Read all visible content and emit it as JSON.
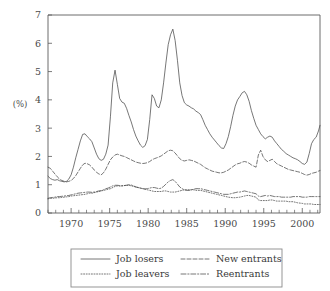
{
  "chart_data": {
    "type": "line",
    "title": "",
    "xlabel": "",
    "ylabel": "(%)",
    "ylim": [
      0,
      7
    ],
    "xlim": [
      1967.0,
      2002.3
    ],
    "yticks": [
      "0",
      "1",
      "2",
      "3",
      "4",
      "5",
      "6",
      "7"
    ],
    "ytick_values": [
      0,
      1,
      2,
      3,
      4,
      5,
      6,
      7
    ],
    "xticks": [
      "1970",
      "1975",
      "1980",
      "1985",
      "1990",
      "1995",
      "2000"
    ],
    "xtick_values": [
      1970,
      1975,
      1980,
      1985,
      1990,
      1995,
      2000
    ],
    "grid": false,
    "legend_position": "below-center",
    "legend_entries": [
      {
        "label": "Job losers",
        "style": "solid"
      },
      {
        "label": "Job leavers",
        "style": "dotted"
      },
      {
        "label": "New entrants",
        "style": "dashed"
      },
      {
        "label": "Reentrants",
        "style": "dashdot"
      }
    ],
    "x": [
      1967.0,
      1967.3,
      1967.6,
      1967.9,
      1968.2,
      1968.5,
      1968.8,
      1969.1,
      1969.4,
      1969.7,
      1970.0,
      1970.3,
      1970.6,
      1970.9,
      1971.2,
      1971.5,
      1971.8,
      1972.1,
      1972.4,
      1972.7,
      1973.0,
      1973.3,
      1973.6,
      1973.9,
      1974.2,
      1974.5,
      1974.8,
      1975.1,
      1975.4,
      1975.7,
      1976.0,
      1976.3,
      1976.6,
      1976.9,
      1977.2,
      1977.5,
      1977.8,
      1978.1,
      1978.4,
      1978.7,
      1979.0,
      1979.3,
      1979.6,
      1979.9,
      1980.2,
      1980.5,
      1980.8,
      1981.1,
      1981.4,
      1981.7,
      1982.0,
      1982.3,
      1982.6,
      1982.9,
      1983.2,
      1983.5,
      1983.8,
      1984.1,
      1984.4,
      1984.7,
      1985.0,
      1985.3,
      1985.6,
      1985.9,
      1986.2,
      1986.5,
      1986.8,
      1987.1,
      1987.4,
      1987.7,
      1988.0,
      1988.3,
      1988.6,
      1988.9,
      1989.2,
      1989.5,
      1989.8,
      1990.1,
      1990.4,
      1990.7,
      1991.0,
      1991.3,
      1991.6,
      1991.9,
      1992.2,
      1992.5,
      1992.8,
      1993.1,
      1993.4,
      1993.7,
      1994.0,
      1994.3,
      1994.6,
      1994.9,
      1995.2,
      1995.5,
      1995.8,
      1996.1,
      1996.4,
      1996.7,
      1997.0,
      1997.3,
      1997.6,
      1997.9,
      1998.2,
      1998.5,
      1998.8,
      1999.1,
      1999.4,
      1999.7,
      2000.0,
      2000.3,
      2000.6,
      2000.9,
      2001.2,
      2001.5,
      2001.8,
      2002.1,
      2002.3
    ],
    "series": [
      {
        "name": "Job losers",
        "style": "solid",
        "values": [
          1.3,
          1.22,
          1.18,
          1.16,
          1.18,
          1.14,
          1.12,
          1.1,
          1.12,
          1.2,
          1.35,
          1.62,
          1.95,
          2.25,
          2.55,
          2.78,
          2.8,
          2.7,
          2.62,
          2.52,
          2.3,
          2.08,
          1.92,
          1.86,
          1.9,
          2.08,
          2.4,
          3.4,
          4.6,
          5.05,
          4.55,
          4.05,
          3.92,
          3.88,
          3.7,
          3.45,
          3.22,
          2.95,
          2.72,
          2.55,
          2.4,
          2.32,
          2.38,
          2.6,
          3.3,
          4.18,
          4.05,
          3.78,
          3.72,
          4.0,
          4.6,
          5.3,
          5.95,
          6.3,
          6.5,
          6.1,
          5.4,
          4.6,
          4.15,
          3.9,
          3.82,
          3.78,
          3.72,
          3.68,
          3.6,
          3.55,
          3.48,
          3.3,
          3.1,
          2.95,
          2.8,
          2.68,
          2.58,
          2.48,
          2.38,
          2.3,
          2.28,
          2.45,
          2.7,
          3.05,
          3.45,
          3.78,
          4.0,
          4.12,
          4.25,
          4.3,
          4.18,
          3.95,
          3.62,
          3.35,
          3.1,
          2.95,
          2.8,
          2.7,
          2.62,
          2.68,
          2.72,
          2.68,
          2.55,
          2.45,
          2.35,
          2.25,
          2.18,
          2.1,
          2.05,
          2.0,
          1.95,
          1.92,
          1.88,
          1.82,
          1.75,
          1.72,
          1.8,
          2.1,
          2.45,
          2.6,
          2.68,
          2.9,
          3.1
        ]
      },
      {
        "name": "New entrants",
        "style": "dashed",
        "values": [
          1.62,
          1.58,
          1.48,
          1.38,
          1.28,
          1.2,
          1.15,
          1.12,
          1.1,
          1.12,
          1.15,
          1.22,
          1.32,
          1.45,
          1.58,
          1.7,
          1.76,
          1.74,
          1.7,
          1.62,
          1.52,
          1.44,
          1.38,
          1.35,
          1.42,
          1.55,
          1.72,
          1.88,
          1.98,
          2.05,
          2.08,
          2.05,
          2.02,
          2.0,
          1.96,
          1.92,
          1.88,
          1.84,
          1.8,
          1.78,
          1.76,
          1.75,
          1.76,
          1.78,
          1.82,
          1.88,
          1.92,
          1.95,
          1.98,
          2.02,
          2.08,
          2.14,
          2.2,
          2.22,
          2.2,
          2.12,
          2.02,
          1.92,
          1.86,
          1.84,
          1.86,
          1.88,
          1.86,
          1.84,
          1.8,
          1.76,
          1.72,
          1.66,
          1.6,
          1.56,
          1.52,
          1.48,
          1.46,
          1.44,
          1.42,
          1.42,
          1.44,
          1.48,
          1.52,
          1.58,
          1.64,
          1.7,
          1.74,
          1.76,
          1.8,
          1.82,
          1.8,
          1.76,
          1.7,
          1.66,
          1.62,
          2.05,
          2.22,
          2.0,
          1.88,
          1.82,
          1.86,
          1.9,
          1.82,
          1.74,
          1.7,
          1.66,
          1.62,
          1.58,
          1.54,
          1.52,
          1.5,
          1.48,
          1.46,
          1.44,
          1.4,
          1.36,
          1.34,
          1.36,
          1.4,
          1.42,
          1.44,
          1.48,
          1.5
        ]
      },
      {
        "name": "Reentrants",
        "style": "dashdot",
        "values": [
          0.52,
          0.54,
          0.55,
          0.56,
          0.58,
          0.58,
          0.59,
          0.6,
          0.61,
          0.62,
          0.64,
          0.66,
          0.68,
          0.7,
          0.71,
          0.72,
          0.73,
          0.74,
          0.74,
          0.73,
          0.74,
          0.76,
          0.78,
          0.79,
          0.82,
          0.86,
          0.88,
          0.92,
          0.96,
          0.98,
          0.98,
          0.97,
          0.96,
          0.97,
          0.98,
          1.0,
          0.99,
          0.96,
          0.92,
          0.9,
          0.88,
          0.86,
          0.85,
          0.86,
          0.88,
          0.9,
          0.9,
          0.88,
          0.86,
          0.88,
          0.94,
          1.02,
          1.1,
          1.15,
          1.18,
          1.12,
          1.02,
          0.92,
          0.86,
          0.82,
          0.8,
          0.8,
          0.82,
          0.84,
          0.86,
          0.86,
          0.86,
          0.84,
          0.82,
          0.8,
          0.78,
          0.76,
          0.74,
          0.72,
          0.7,
          0.68,
          0.66,
          0.66,
          0.66,
          0.68,
          0.7,
          0.72,
          0.74,
          0.74,
          0.76,
          0.78,
          0.76,
          0.74,
          0.72,
          0.7,
          0.68,
          0.6,
          0.58,
          0.6,
          0.62,
          0.6,
          0.62,
          0.6,
          0.58,
          0.58,
          0.58,
          0.56,
          0.56,
          0.56,
          0.56,
          0.56,
          0.58,
          0.58,
          0.58,
          0.58,
          0.56,
          0.56,
          0.56,
          0.58,
          0.58,
          0.58,
          0.58,
          0.58,
          0.58
        ]
      },
      {
        "name": "Job leavers",
        "style": "dotted",
        "values": [
          0.5,
          0.52,
          0.52,
          0.53,
          0.54,
          0.54,
          0.55,
          0.56,
          0.57,
          0.58,
          0.6,
          0.61,
          0.62,
          0.63,
          0.64,
          0.65,
          0.66,
          0.68,
          0.7,
          0.7,
          0.72,
          0.74,
          0.76,
          0.78,
          0.8,
          0.82,
          0.84,
          0.86,
          0.9,
          0.94,
          0.96,
          0.95,
          0.96,
          0.97,
          0.98,
          0.98,
          0.96,
          0.94,
          0.92,
          0.9,
          0.88,
          0.86,
          0.84,
          0.82,
          0.8,
          0.78,
          0.76,
          0.76,
          0.76,
          0.76,
          0.78,
          0.78,
          0.76,
          0.74,
          0.74,
          0.74,
          0.76,
          0.78,
          0.8,
          0.82,
          0.82,
          0.82,
          0.82,
          0.82,
          0.8,
          0.8,
          0.8,
          0.78,
          0.76,
          0.74,
          0.72,
          0.7,
          0.68,
          0.66,
          0.64,
          0.62,
          0.6,
          0.58,
          0.56,
          0.55,
          0.54,
          0.54,
          0.55,
          0.56,
          0.58,
          0.6,
          0.62,
          0.62,
          0.6,
          0.58,
          0.56,
          0.46,
          0.44,
          0.44,
          0.44,
          0.44,
          0.46,
          0.46,
          0.44,
          0.42,
          0.42,
          0.42,
          0.42,
          0.42,
          0.4,
          0.4,
          0.4,
          0.38,
          0.36,
          0.35,
          0.34,
          0.32,
          0.32,
          0.32,
          0.32,
          0.3,
          0.3,
          0.3,
          0.3
        ]
      }
    ]
  }
}
